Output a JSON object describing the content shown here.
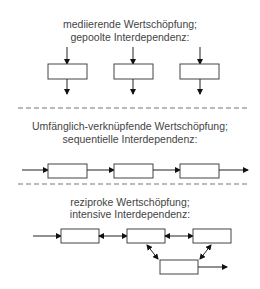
{
  "sections": [
    {
      "title_line1": "mediierende Wertschöpfung;",
      "title_line2": "gepoolte Interdependenz:",
      "type": "pooled"
    },
    {
      "title_line1": "Umfänglich-verknüpfende Wertschöpfung;",
      "title_line2": "sequentielle Interdependenz:",
      "type": "sequential"
    },
    {
      "title_line1": "reziproke Wertschöpfung;",
      "title_line2": "intensive Interdependenz:",
      "type": "reciprocal"
    }
  ],
  "colors": {
    "text": "#444444",
    "line": "#222222",
    "divider": "#777777"
  }
}
